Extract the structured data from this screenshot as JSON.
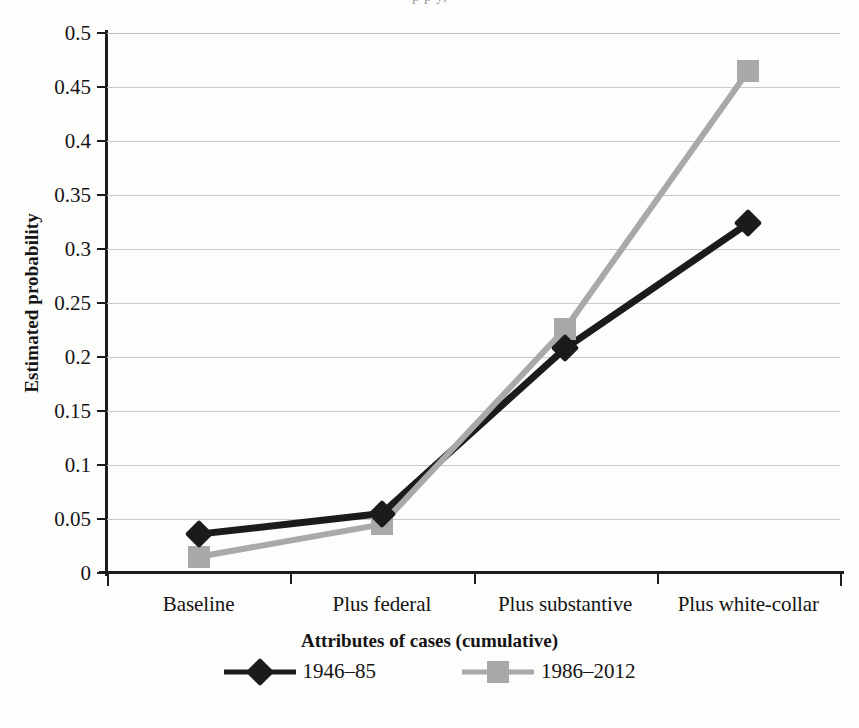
{
  "figure": {
    "title_remnant": "p p     y,",
    "background_color": "#fdfdfc"
  },
  "chart_data": {
    "type": "line",
    "title": "",
    "xlabel": "Attributes of cases (cumulative)",
    "ylabel": "Estimated probability",
    "categories": [
      "Baseline",
      "Plus federal",
      "Plus substantive",
      "Plus white-collar"
    ],
    "ylim": [
      0,
      0.5
    ],
    "ytick_step": 0.05,
    "ytick_labels": [
      "0",
      "0.05",
      "0.1",
      "0.15",
      "0.2",
      "0.25",
      "0.3",
      "0.35",
      "0.4",
      "0.45",
      "0.5"
    ],
    "ytick_values": [
      0,
      0.05,
      0.1,
      0.15,
      0.2,
      0.25,
      0.3,
      0.35,
      0.4,
      0.45,
      0.5
    ],
    "grid": "horizontal",
    "legend_position": "bottom",
    "series": [
      {
        "name": "1946–85",
        "marker": "diamond",
        "color": "#1b1b1b",
        "values": [
          0.036,
          0.055,
          0.208,
          0.324
        ]
      },
      {
        "name": "1986–2012",
        "marker": "square",
        "color": "#a9a9a9",
        "values": [
          0.015,
          0.045,
          0.226,
          0.465
        ]
      }
    ]
  },
  "legend": {
    "items": [
      {
        "label": "1946–85",
        "marker": "diamond-marker",
        "color": "#1b1b1b"
      },
      {
        "label": "1986–2012",
        "marker": "square-marker",
        "color": "#a9a9a9"
      }
    ]
  },
  "colors": {
    "series_dark": "#1b1b1b",
    "series_gray": "#a9a9a9",
    "gridline": "#c9c9c9",
    "axis": "#1d1d1d",
    "text": "#141414"
  }
}
